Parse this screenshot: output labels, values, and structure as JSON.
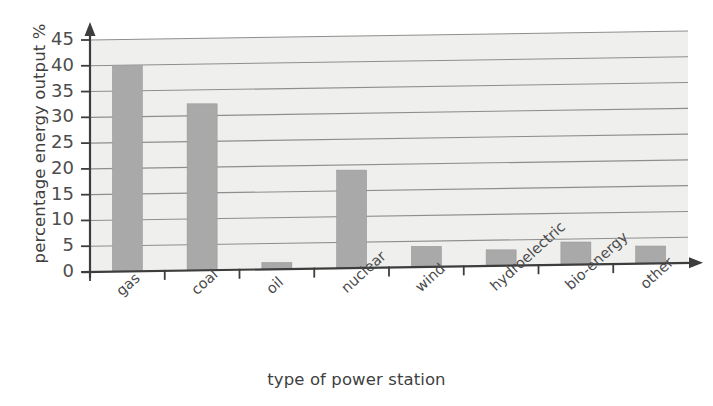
{
  "chart_data": {
    "type": "bar",
    "title": "",
    "subtitle": "",
    "xlabel": "type of power station",
    "ylabel": "percentage energy output %",
    "categories": [
      "gas",
      "coal",
      "oil",
      "nuclear",
      "wind",
      "hydroelectric",
      "bio-energy",
      "other"
    ],
    "values": [
      40,
      32.3,
      1.3,
      19,
      4,
      3.1,
      4.4,
      3.4
    ],
    "ylim": [
      0,
      45
    ],
    "ytick_labels": [
      "0",
      "5",
      "10",
      "15",
      "20",
      "25",
      "30",
      "35",
      "40",
      "45"
    ],
    "ytick_values": [
      0,
      5,
      10,
      15,
      20,
      25,
      30,
      35,
      40,
      45
    ],
    "grid": "horizontal",
    "legend": "none",
    "bar_color": "#a9a9a9",
    "plot_background": "#efefed",
    "gridline_color": "#8e8e8e",
    "axis_color": "#3d3d3d"
  },
  "axis": {
    "y_title": "percentage energy output %",
    "x_title": "type of power station"
  }
}
